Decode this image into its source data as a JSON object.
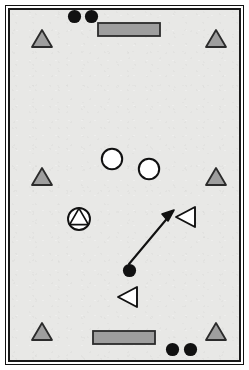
{
  "figure": {
    "type": "schematic-field-diagram",
    "title": "",
    "surface_color": "#e8e8e6",
    "border_color": "#1a1a1a",
    "background_color": "#ffffff",
    "width": 249,
    "height": 370
  },
  "palette": {
    "gray_fill": "#9e9e9e",
    "gray_outline": "#2b2b2b",
    "black": "#111111",
    "white": "#ffffff",
    "arrow": "#111111"
  },
  "legend_shapes": {
    "gray_triangle": "gray-filled-triangle-marker",
    "gray_rectangle": "gray-filled-goal-rectangle",
    "black_dot": "black-filled-circle-marker",
    "white_circle": "white-open-circle-marker",
    "circle_triangle": "circle-with-inscribed-triangle-marker",
    "left_triangle": "white-left-pointing-triangle-marker",
    "arrow": "motion-arrow"
  },
  "markers": {
    "gray_triangles": [
      {
        "id": "gray-triangle-top-left",
        "cx": 41,
        "cy": 40,
        "size": 20
      },
      {
        "id": "gray-triangle-top-right",
        "cx": 215,
        "cy": 40,
        "size": 20
      },
      {
        "id": "gray-triangle-middle-left",
        "cx": 41,
        "cy": 178,
        "size": 20
      },
      {
        "id": "gray-triangle-middle-right",
        "cx": 215,
        "cy": 178,
        "size": 20
      },
      {
        "id": "gray-triangle-bottom-left",
        "cx": 41,
        "cy": 333,
        "size": 20
      },
      {
        "id": "gray-triangle-bottom-right",
        "cx": 215,
        "cy": 333,
        "size": 20
      }
    ],
    "gray_rectangles": [
      {
        "id": "goal-rectangle-top",
        "x": 97,
        "y": 22,
        "width": 62,
        "height": 13
      },
      {
        "id": "goal-rectangle-bottom",
        "x": 92,
        "y": 330,
        "width": 62,
        "height": 13
      }
    ],
    "black_dots": [
      {
        "id": "black-dot-top-left",
        "cx": 74,
        "cy": 16,
        "r": 7
      },
      {
        "id": "black-dot-top-right",
        "cx": 91,
        "cy": 16,
        "r": 7
      },
      {
        "id": "black-dot-bottom-left",
        "cx": 172,
        "cy": 349,
        "r": 7
      },
      {
        "id": "black-dot-bottom-right",
        "cx": 190,
        "cy": 349,
        "r": 7
      },
      {
        "id": "black-dot-center-ball",
        "cx": 129,
        "cy": 270,
        "r": 7
      }
    ],
    "white_circles": [
      {
        "id": "white-circle-left",
        "cx": 112,
        "cy": 159,
        "r": 11
      },
      {
        "id": "white-circle-right",
        "cx": 149,
        "cy": 169,
        "r": 11
      }
    ],
    "circle_triangles": [
      {
        "id": "circle-triangle-left",
        "cx": 79,
        "cy": 219,
        "r": 12
      }
    ],
    "left_triangles": [
      {
        "id": "left-triangle-upper",
        "cx": 186,
        "cy": 217,
        "size": 21
      },
      {
        "id": "left-triangle-lower",
        "cx": 128,
        "cy": 297,
        "size": 21
      }
    ],
    "arrows": [
      {
        "id": "motion-arrow-ball-to-player",
        "x1": 129,
        "y1": 264,
        "x2": 173,
        "y2": 212,
        "head_size": 9
      }
    ]
  }
}
